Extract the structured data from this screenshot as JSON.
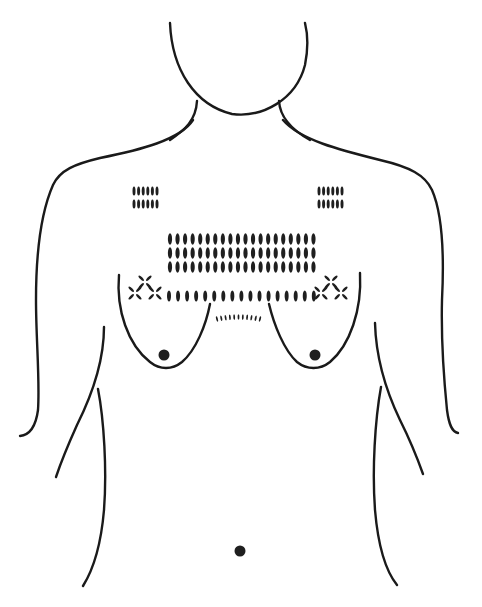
{
  "figure": {
    "title": "Torso line drawing with chest scarification pattern",
    "colors": {
      "ink": "#1a1a1a",
      "background": "#ffffff"
    },
    "patterns": {
      "upper_left_block": {
        "rows": 2,
        "cols": 6,
        "x0": 134,
        "y0": 191,
        "dx": 4.6,
        "dy": 13,
        "rx": 1.5,
        "ry": 4.5
      },
      "upper_right_block": {
        "rows": 2,
        "cols": 6,
        "x0": 319,
        "y0": 191,
        "dx": 4.6,
        "dy": 13,
        "rx": 1.5,
        "ry": 4.5
      },
      "central_grid": {
        "rows": 3,
        "cols": 20,
        "x0": 170,
        "y0": 239,
        "dx": 7.55,
        "dy": 14,
        "rx": 2.1,
        "ry": 5.8
      },
      "horizontal_row": {
        "count": 17,
        "x0": 169,
        "y": 296,
        "dx": 9.05,
        "rx": 2.0,
        "ry": 5.5
      },
      "arc_ticks": {
        "count": 11,
        "x0": 217,
        "dx": 4.3
      },
      "star_left": {
        "cx": 145,
        "cy": 292
      },
      "star_right": {
        "cx": 331,
        "cy": 292
      }
    },
    "points": {
      "left_nipple": {
        "cx": 164,
        "cy": 355,
        "r": 5.5
      },
      "right_nipple": {
        "cx": 315,
        "cy": 355,
        "r": 5.5
      },
      "navel": {
        "cx": 240,
        "cy": 551,
        "r": 5.5
      }
    }
  }
}
